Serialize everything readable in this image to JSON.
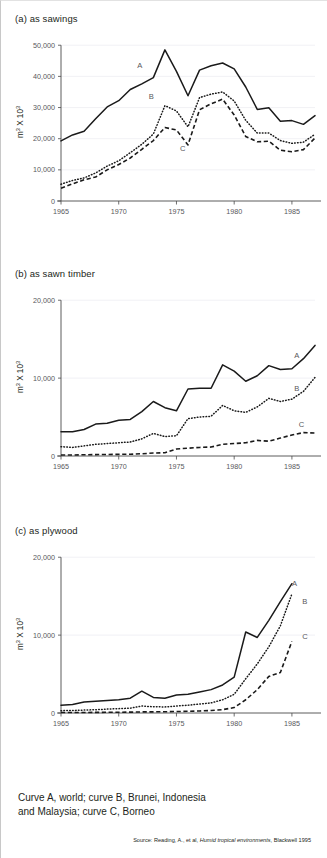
{
  "figure": {
    "caption_line1": "Curve A, world; curve B, Brunei, Indonesia",
    "caption_line2": "and Malaysia; curve C, Borneo",
    "source_prefix": "Source: Reading, A., et al, ",
    "source_title": "Humid tropical environments",
    "source_suffix": ", Blackwell 1995"
  },
  "chart_data": [
    {
      "id": "a",
      "type": "line",
      "title": "(a) as sawings",
      "xlabel": "",
      "ylabel": "m³ X 10³",
      "ylabel_base": "m",
      "ylabel_sup1": "3",
      "ylabel_mid": " X 10",
      "ylabel_sup2": "3",
      "xlim": [
        1965,
        1987
      ],
      "ylim": [
        0,
        52000
      ],
      "xticks": [
        1965,
        1970,
        1975,
        1980,
        1985
      ],
      "xtick_labels": [
        "1965",
        "1970",
        "1975",
        "1980",
        "1985"
      ],
      "yticks": [
        0,
        10000,
        20000,
        30000,
        40000,
        50000
      ],
      "ytick_labels": [
        "0",
        "10,000",
        "20,000",
        "30,000",
        "40,000",
        "50,000"
      ],
      "grid": true,
      "legend_position": "inline-annotations",
      "x": [
        1965,
        1966,
        1967,
        1968,
        1969,
        1970,
        1971,
        1972,
        1973,
        1974,
        1975,
        1976,
        1977,
        1978,
        1979,
        1980,
        1981,
        1982,
        1983,
        1984,
        1985,
        1986,
        1987
      ],
      "series": [
        {
          "name": "A",
          "label": "A",
          "style": "solid",
          "annotation_x": 1971.6,
          "annotation_y": 42600,
          "values": [
            19300,
            21200,
            22400,
            26400,
            30200,
            32200,
            35800,
            37600,
            39600,
            48500,
            41600,
            33800,
            42000,
            43400,
            44300,
            42400,
            36600,
            29400,
            29900,
            25600,
            25800,
            24600,
            27400
          ]
        },
        {
          "name": "B",
          "label": "B",
          "style": "dotted",
          "annotation_x": 1972.6,
          "annotation_y": 32900,
          "values": [
            5400,
            6600,
            7400,
            9000,
            11200,
            12900,
            15500,
            18200,
            21500,
            30600,
            28900,
            23800,
            33200,
            34300,
            35000,
            32100,
            25900,
            21800,
            21800,
            19400,
            18500,
            18900,
            21400
          ]
        },
        {
          "name": "C",
          "label": "C",
          "style": "dashed",
          "annotation_x": 1975.3,
          "annotation_y": 15900,
          "values": [
            4100,
            5500,
            6800,
            7700,
            10000,
            11700,
            13800,
            16600,
            19400,
            23600,
            22800,
            18000,
            29300,
            31200,
            32700,
            27600,
            20700,
            19000,
            19200,
            16300,
            15800,
            16500,
            20200
          ]
        }
      ]
    },
    {
      "id": "b",
      "type": "line",
      "title": "(b) as sawn timber",
      "xlabel": "",
      "ylabel": "m³ X 10³",
      "ylabel_base": "m",
      "ylabel_sup1": "3",
      "ylabel_mid": " X 10",
      "ylabel_sup2": "3",
      "xlim": [
        1965,
        1987
      ],
      "ylim": [
        0,
        20800
      ],
      "xticks": [
        1965,
        1970,
        1975,
        1980,
        1985
      ],
      "xtick_labels": [
        "1965",
        "1970",
        "1975",
        "1980",
        "1985"
      ],
      "yticks": [
        0,
        10000,
        20000
      ],
      "ytick_labels": [
        "0",
        "10,000",
        "20,000"
      ],
      "grid": true,
      "legend_position": "inline-annotations",
      "x": [
        1965,
        1966,
        1967,
        1968,
        1969,
        1970,
        1971,
        1972,
        1973,
        1974,
        1975,
        1976,
        1977,
        1978,
        1979,
        1980,
        1981,
        1982,
        1983,
        1984,
        1985,
        1986,
        1987
      ],
      "series": [
        {
          "name": "A",
          "label": "A",
          "style": "solid",
          "annotation_x": 1985.2,
          "annotation_y": 12600,
          "values": [
            3100,
            3100,
            3400,
            4100,
            4200,
            4600,
            4700,
            5700,
            7000,
            6200,
            5800,
            8600,
            8700,
            8700,
            11700,
            10900,
            9600,
            10300,
            11600,
            11100,
            11200,
            12500,
            14200
          ]
        },
        {
          "name": "B",
          "label": "B",
          "style": "dotted",
          "annotation_x": 1985.2,
          "annotation_y": 8300,
          "values": [
            1200,
            1100,
            1300,
            1500,
            1600,
            1700,
            1800,
            2200,
            2900,
            2500,
            2600,
            4800,
            5000,
            5100,
            6500,
            5800,
            5600,
            6300,
            7400,
            7000,
            7300,
            8300,
            10100
          ]
        },
        {
          "name": "C",
          "label": "C",
          "style": "dashed",
          "annotation_x": 1985.6,
          "annotation_y": 3700,
          "values": [
            120,
            130,
            160,
            180,
            200,
            210,
            230,
            290,
            380,
            420,
            900,
            1000,
            1100,
            1150,
            1500,
            1600,
            1700,
            2000,
            1900,
            2300,
            2700,
            3000,
            2950
          ]
        }
      ]
    },
    {
      "id": "c",
      "type": "line",
      "title": "(c) as plywood",
      "xlabel": "",
      "ylabel": "m³ X 10³",
      "ylabel_base": "m",
      "ylabel_sup1": "3",
      "ylabel_mid": " X 10",
      "ylabel_sup2": "3",
      "xlim": [
        1965,
        1987
      ],
      "ylim": [
        0,
        20800
      ],
      "xticks": [
        1965,
        1970,
        1975,
        1980,
        1985
      ],
      "xtick_labels": [
        "1965",
        "1970",
        "1975",
        "1980",
        "1985"
      ],
      "yticks": [
        0,
        10000,
        20000
      ],
      "ytick_labels": [
        "0",
        "10,000",
        "20,000"
      ],
      "grid": true,
      "legend_position": "inline-annotations",
      "x": [
        1965,
        1966,
        1967,
        1968,
        1969,
        1970,
        1971,
        1972,
        1973,
        1974,
        1975,
        1976,
        1977,
        1978,
        1979,
        1980,
        1981,
        1982,
        1983,
        1984,
        1985,
        1986,
        1987
      ],
      "series": [
        {
          "name": "A",
          "label": "A",
          "style": "solid",
          "annotation_x": 1985.0,
          "annotation_y": 16300,
          "values": [
            1000,
            1100,
            1400,
            1500,
            1600,
            1700,
            1900,
            2800,
            2000,
            1900,
            2300,
            2400,
            2700,
            3000,
            3600,
            4600,
            10400,
            9700,
            11900,
            14300,
            16600,
            0,
            0
          ]
        },
        {
          "name": "B",
          "label": "B",
          "style": "dotted",
          "annotation_x": 1985.9,
          "annotation_y": 14000,
          "values": [
            300,
            320,
            380,
            420,
            500,
            560,
            620,
            900,
            800,
            780,
            900,
            1000,
            1150,
            1300,
            1700,
            2400,
            4400,
            6300,
            8500,
            11200,
            15300,
            0,
            0
          ]
        },
        {
          "name": "C",
          "label": "C",
          "style": "dashed",
          "annotation_x": 1985.9,
          "annotation_y": 9500,
          "values": [
            60,
            60,
            70,
            80,
            90,
            100,
            110,
            140,
            150,
            160,
            190,
            220,
            260,
            320,
            430,
            700,
            1700,
            3000,
            4700,
            5200,
            9200,
            0,
            0
          ]
        }
      ]
    }
  ]
}
